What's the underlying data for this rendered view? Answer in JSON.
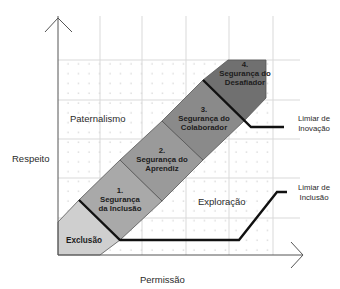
{
  "axes": {
    "y_label": "Respeito",
    "x_label": "Permissão"
  },
  "regions": {
    "top_left": "Paternalismo",
    "bottom_right": "Exploração"
  },
  "stages": [
    {
      "number": "1.",
      "line1": "Segurança",
      "line2": "da Inclusão",
      "color": "#a9a9a9"
    },
    {
      "number": "2.",
      "line1": "Segurança do",
      "line2": "Aprendiz",
      "color": "#9a9a9a"
    },
    {
      "number": "3.",
      "line1": "Segurança do",
      "line2": "Colaborador",
      "color": "#8a8a8a"
    },
    {
      "number": "4.",
      "line1": "Segurança do",
      "line2": "Desafiador",
      "color": "#707070"
    }
  ],
  "exclusion": {
    "label": "Exclusão",
    "color": "#cfcfcf"
  },
  "thresholds": [
    {
      "line1": "Limiar de",
      "line2": "Inovação"
    },
    {
      "line1": "Limiar de",
      "line2": "Inclusão"
    }
  ],
  "colors": {
    "grid": "#d9d9d9",
    "dots": "#bdbdbd",
    "axis": "#555555",
    "threshold": "#111111",
    "band_edge": "#555555"
  }
}
